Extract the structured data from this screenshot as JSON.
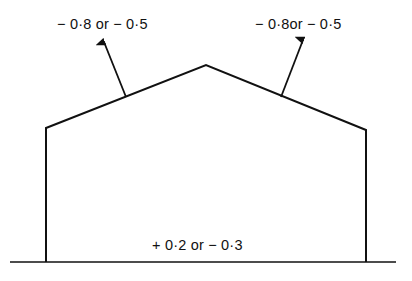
{
  "diagram": {
    "type": "building-section-wind-pressure-coefficients",
    "labels": {
      "left_roof_slope": "− 0·8 or − 0·5",
      "right_roof_slope": "− 0·8or − 0·5",
      "internal": "+ 0·2 or − 0·3"
    },
    "colors": {
      "line": "#111111",
      "background": "#ffffff"
    }
  }
}
